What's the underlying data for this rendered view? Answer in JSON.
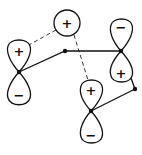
{
  "diagram": {
    "type": "orbital-overlap",
    "s_orbital": {
      "sign": "+"
    },
    "p_orbitals": [
      {
        "id": "left",
        "upper_sign": "+",
        "lower_sign": "−"
      },
      {
        "id": "right",
        "upper_sign": "−",
        "lower_sign": "+"
      },
      {
        "id": "bottom",
        "upper_sign": "+",
        "lower_sign": "−"
      }
    ],
    "colors": {
      "line": "#111111",
      "background": "#ffffff"
    }
  }
}
